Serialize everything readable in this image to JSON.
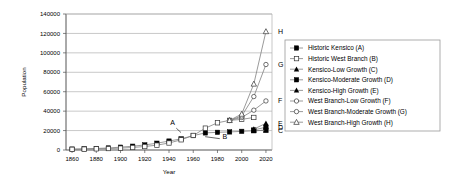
{
  "chart_data": {
    "type": "line",
    "title": "",
    "xlabel": "Year",
    "ylabel": "Population",
    "xlim": [
      1855,
      2025
    ],
    "ylim": [
      0,
      140000
    ],
    "xticks": [
      1860,
      1880,
      1900,
      1920,
      1940,
      1960,
      1980,
      2000,
      2020
    ],
    "yticks": [
      0,
      20000,
      40000,
      60000,
      80000,
      100000,
      120000,
      140000
    ],
    "grid": "horizontal",
    "legend_position": "right",
    "series": [
      {
        "name": "Historic Kensico (A)",
        "key": "A",
        "marker": "filled-square",
        "x": [
          1860,
          1870,
          1880,
          1890,
          1900,
          1910,
          1920,
          1930,
          1940,
          1950,
          1960,
          1970,
          1980,
          1990,
          2000,
          2010,
          2020
        ],
        "values": [
          900,
          1200,
          1600,
          2100,
          2900,
          3900,
          5200,
          7000,
          9200,
          11500,
          14800,
          17600,
          18200,
          18600,
          19200,
          19800,
          20400
        ]
      },
      {
        "name": "Historic West Branch (B)",
        "key": "B",
        "marker": "open-square",
        "x": [
          1860,
          1870,
          1880,
          1890,
          1900,
          1910,
          1920,
          1930,
          1940,
          1950,
          1960,
          1970,
          1980,
          1990,
          2000,
          2010
        ],
        "values": [
          700,
          900,
          1200,
          1500,
          1900,
          2600,
          3600,
          5000,
          7200,
          10500,
          15000,
          22500,
          28000,
          30500,
          31500,
          33500
        ]
      },
      {
        "name": "Kensico-Low Growth (C)",
        "key": "C",
        "marker": "filled-triangle",
        "x": [
          2010,
          2020
        ],
        "values": [
          19800,
          20400
        ]
      },
      {
        "name": "Kensico-Moderate Growth (D)",
        "key": "D",
        "marker": "filled-square",
        "x": [
          2010,
          2020
        ],
        "values": [
          20600,
          23500
        ]
      },
      {
        "name": "Kensico-High Growth (E)",
        "key": "E",
        "marker": "filled-triangle",
        "x": [
          2010,
          2020
        ],
        "values": [
          21500,
          27500
        ]
      },
      {
        "name": "West Branch-Low Growth (F)",
        "key": "F",
        "marker": "open-circle",
        "x": [
          1990,
          2000,
          2010,
          2020
        ],
        "values": [
          30500,
          33500,
          41000,
          50500
        ]
      },
      {
        "name": "West Branch-Moderate Growth (G)",
        "key": "G",
        "marker": "open-circle",
        "x": [
          1990,
          2000,
          2010,
          2020
        ],
        "values": [
          30500,
          35000,
          55000,
          88000
        ]
      },
      {
        "name": "West Branch-High Growth (H)",
        "key": "H",
        "marker": "open-triangle",
        "x": [
          1990,
          2000,
          2010,
          2020
        ],
        "values": [
          30500,
          37000,
          68000,
          122000
        ]
      }
    ],
    "endpoint_labels": [
      {
        "label": "H",
        "value": 122000
      },
      {
        "label": "G",
        "value": 88000
      },
      {
        "label": "F",
        "value": 50500
      },
      {
        "label": "E",
        "value": 27500
      },
      {
        "label": "D",
        "value": 23500
      },
      {
        "label": "C",
        "value": 20400
      }
    ],
    "annotations": [
      {
        "label": "A",
        "x": 1943,
        "y": 26000,
        "target_x": 1952,
        "target_y": 15500
      },
      {
        "label": "B",
        "x": 1986,
        "y": 11000,
        "target_x": 1967,
        "target_y": 14200
      }
    ]
  },
  "legend": {
    "items": [
      {
        "label": "Historic Kensico (A)",
        "marker": "filled-square"
      },
      {
        "label": "Historic West Branch (B)",
        "marker": "open-square"
      },
      {
        "label": "Kensico-Low Growth (C)",
        "marker": "filled-triangle"
      },
      {
        "label": "Kensico-Moderate Growth (D)",
        "marker": "filled-square"
      },
      {
        "label": "Kensico-High Growth (E)",
        "marker": "filled-triangle"
      },
      {
        "label": "West Branch-Low Growth (F)",
        "marker": "open-circle"
      },
      {
        "label": "West Branch-Moderate Growth (G)",
        "marker": "open-circle"
      },
      {
        "label": "West Branch-High Growth (H)",
        "marker": "open-triangle"
      }
    ]
  },
  "colors": {
    "line": "#808080",
    "marker": "#000000",
    "grid": "#b0b0b0",
    "axis": "#666666",
    "legend_border": "#999999",
    "background": "#ffffff"
  }
}
